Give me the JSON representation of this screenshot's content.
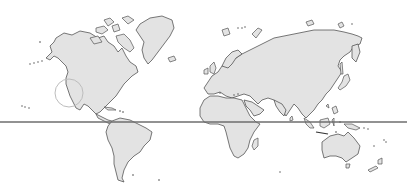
{
  "map": {
    "width": 407,
    "height": 191,
    "colors": {
      "ocean": "#ffffff",
      "land_fill": "#e3e3e3",
      "land_stroke": "#555555",
      "equator_line": "#6e6e6e",
      "marker_circle": "#bdbdbd"
    },
    "equator": {
      "y": 122,
      "x1": 0,
      "x2": 407
    },
    "marker": {
      "cx": 69,
      "cy": 93,
      "r": 14,
      "location": "California coast"
    },
    "continents": [
      "North America",
      "Greenland",
      "South America",
      "Europe",
      "Africa",
      "Asia",
      "Australia",
      "Antarctica-free view"
    ]
  }
}
